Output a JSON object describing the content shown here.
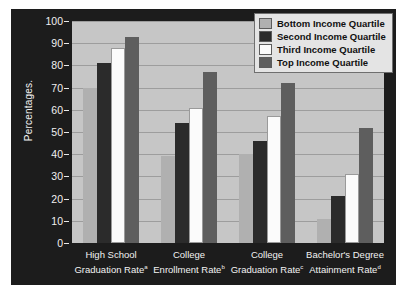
{
  "chart_data": {
    "type": "bar",
    "title": "",
    "xlabel": "",
    "ylabel": "Percentages.",
    "ylim": [
      0,
      100
    ],
    "ytick_values": [
      100,
      90,
      80,
      70,
      60,
      50,
      40,
      30,
      20,
      10,
      0
    ],
    "grid": true,
    "legend_position": "top-right",
    "categories": [
      "High School Graduation Rate",
      "College Enrollment Rate",
      "College Graduation Rate",
      "Bachelor's Degree Attainment Rate"
    ],
    "category_footnotes": [
      "a",
      "b",
      "c",
      "d"
    ],
    "category_lines": [
      [
        "High School",
        "Graduation Rate"
      ],
      [
        "College",
        "Enrollment Rate"
      ],
      [
        "College",
        "Graduation Rate"
      ],
      [
        "Bachelor's Degree",
        "Attainment Rate"
      ]
    ],
    "series": [
      {
        "name": "Bottom Income Quartile",
        "color": "#b0b0b0",
        "values": [
          70,
          39,
          40,
          11
        ],
        "labels": [
          "70%",
          "39%",
          "40%",
          "11%"
        ]
      },
      {
        "name": "Second Income Quartile",
        "color": "#2b2b2b",
        "values": [
          81,
          54,
          46,
          21
        ],
        "labels": [
          "81%",
          "54%",
          "46%",
          "21%"
        ]
      },
      {
        "name": "Third Income Quartile",
        "color": "#fbfbfb",
        "values": [
          88,
          61,
          57,
          31
        ],
        "labels": [
          "88%",
          "61%",
          "57%",
          "31%"
        ]
      },
      {
        "name": "Top Income Quartile",
        "color": "#5e5e5e",
        "values": [
          93,
          77,
          72,
          52
        ],
        "labels": [
          "93%",
          "77%",
          "72%",
          "52%"
        ]
      }
    ]
  },
  "legend": {
    "items": [
      {
        "label": "Bottom Income Quartile",
        "color": "#b0b0b0"
      },
      {
        "label": "Second Income Quartile",
        "color": "#2b2b2b"
      },
      {
        "label": "Third Income Quartile",
        "color": "#fbfbfb"
      },
      {
        "label": "Top Income Quartile",
        "color": "#5e5e5e"
      }
    ]
  },
  "colors": {
    "figure_background": "#1c1c1c",
    "plot_background": "#c6c6c6",
    "gridline": "#9d9d9d",
    "axis_text": "#f2f2f2",
    "value_text": "#2a2a2a"
  }
}
